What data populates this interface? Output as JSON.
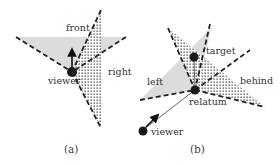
{
  "panels": [
    {
      "id": "a",
      "caption": "(a)",
      "labels": {
        "front": "front",
        "right": "right",
        "viewer": "viewer"
      }
    },
    {
      "id": "b",
      "caption": "(b)",
      "labels": {
        "target": "target",
        "left": "left",
        "behind": "behind",
        "relatum": "relatum",
        "viewer": "viewer"
      }
    }
  ],
  "colors": {
    "gray_region": "#dcdcdc",
    "dot_fill": "#1a1a1a",
    "dashed_line": "#222222",
    "text": "#333333"
  }
}
